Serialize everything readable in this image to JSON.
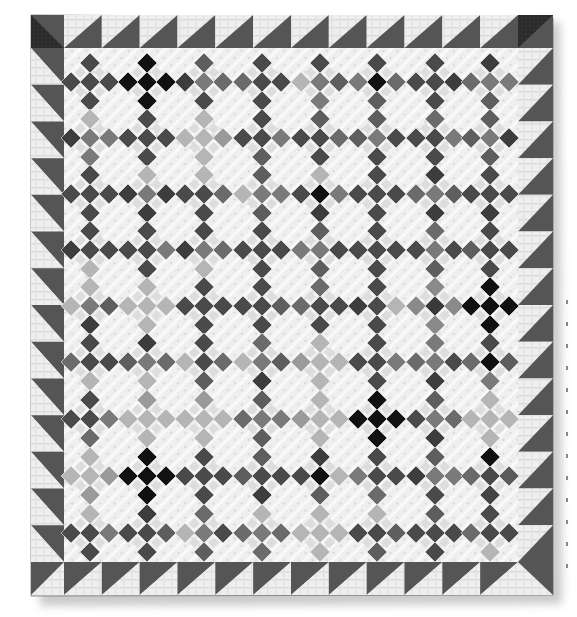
{
  "image": {
    "subject": "Nine-patch quilt photographed flat",
    "description": "Antique scrap quilt of on-point nine-patch cross blocks set with light shirting sashing, surrounded by a sawtooth (half-square triangle) border with dark corner squares",
    "palette": {
      "background": "#ffffff",
      "shirting_light": "#eeeeee",
      "shirting_mid": "#d9d9d9",
      "sawtooth_dark": "#555555",
      "corner_dark": "#2b2b2b",
      "patch_black": "#111111",
      "patch_dark": "#4a4a4a",
      "patch_mid": "#7a7a7a",
      "patch_light": "#b5b5b5",
      "shadow": "#c8c8c8"
    }
  },
  "quilt": {
    "bounds": {
      "left": 31,
      "top": 15,
      "right": 553,
      "bottom": 595
    },
    "inner_bounds": {
      "left": 64,
      "top": 48,
      "right": 518,
      "bottom": 562
    },
    "border": {
      "type": "sawtooth",
      "blocks_top": 12,
      "blocks_bottom": 12,
      "blocks_left": 14,
      "blocks_right": 14,
      "corner_blocks": 4
    },
    "body": {
      "block": "on-point nine-patch cross (5 diamond patches)",
      "columns": 8,
      "rows": 9,
      "col_centers": [
        90,
        147,
        204,
        262,
        320,
        377,
        435,
        490
      ],
      "row_centers": [
        82,
        138,
        194,
        250,
        306,
        362,
        419,
        476,
        533
      ],
      "arm_offset": 19,
      "patch_half_diag": 10,
      "tones": [
        [
          "dark",
          "black",
          "mid",
          "dark",
          "mid",
          "center-black",
          "dark",
          "mid"
        ],
        [
          "mid",
          "dark",
          "light",
          "dark",
          "dark",
          "mid",
          "dark",
          "mid"
        ],
        [
          "dark",
          "mid",
          "dark",
          "mid",
          "center-black",
          "dark",
          "mid",
          "dark"
        ],
        [
          "dark",
          "dark",
          "mid",
          "dark",
          "mid",
          "dark",
          "mid",
          "dark"
        ],
        [
          "mid",
          "light",
          "dark",
          "dark",
          "dark",
          "dark",
          "accent",
          "black"
        ],
        [
          "dark",
          "mid",
          "dark",
          "mid",
          "light",
          "dark",
          "mid",
          "center-black"
        ],
        [
          "dark",
          "light",
          "light",
          "mid",
          "light",
          "black",
          "mid",
          "light"
        ],
        [
          "light",
          "black",
          "dark",
          "dark",
          "center-black",
          "dark",
          "mid",
          "mixed"
        ],
        [
          "dark",
          "dark",
          "mid",
          "mid",
          "light",
          "dark",
          "dark",
          "dark"
        ]
      ]
    }
  },
  "margin_marks": {
    "count": 13
  }
}
